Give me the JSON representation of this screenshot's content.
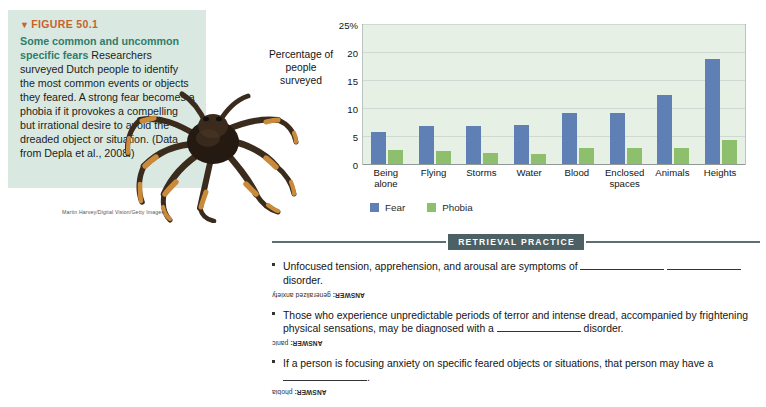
{
  "figure": {
    "number_label": "FIGURE 50.1",
    "triangle_glyph": "▼",
    "title": "Some common and uncommon specific fears",
    "body": " Researchers surveyed Dutch people to identify the most common events or objects they feared. A strong fear becomes a phobia if it provokes a compelling but irrational desire to avoid the dreaded object or situation. (Data from Depla et al., 2008.)",
    "photo_credit": "Martin Harvey/Digital Vision/Getty Images",
    "panel_color": "#d9e9e2",
    "number_color": "#c8622a",
    "title_color": "#2f7d6a"
  },
  "chart_data": {
    "type": "bar",
    "title": "",
    "xlabel": "",
    "ylabel": "Percentage of people surveyed",
    "ylim": [
      0,
      25
    ],
    "yticks": [
      0,
      5,
      10,
      15,
      20,
      25
    ],
    "ytick_labels": [
      "0",
      "5",
      "10",
      "15",
      "20",
      "25%"
    ],
    "grid": true,
    "legend_position": "bottom-left",
    "categories": [
      "Being alone",
      "Flying",
      "Storms",
      "Water",
      "Blood",
      "Enclosed spaces",
      "Animals",
      "Heights"
    ],
    "category_lines": [
      [
        "Being",
        "alone"
      ],
      [
        "Flying"
      ],
      [
        "Storms"
      ],
      [
        "Water"
      ],
      [
        "Blood"
      ],
      [
        "Enclosed",
        "spaces"
      ],
      [
        "Animals"
      ],
      [
        "Heights"
      ]
    ],
    "series": [
      {
        "name": "Fear",
        "color": "#5f80b4",
        "values": [
          5.9,
          7.0,
          7.0,
          7.1,
          9.3,
          9.3,
          12.5,
          19.0
        ]
      },
      {
        "name": "Phobia",
        "color": "#8dbf6d",
        "values": [
          2.7,
          2.5,
          2.1,
          1.9,
          3.1,
          3.1,
          3.0,
          4.5
        ]
      }
    ]
  },
  "retrieval_practice": {
    "heading": "RETRIEVAL PRACTICE",
    "questions": [
      {
        "text_before": "Unfocused tension, apprehension, and arousal are symptoms of ",
        "text_middle": " ",
        "text_after": " disorder.",
        "answer_prefix": "ANSWER:",
        "answer": " generalized anxiety"
      },
      {
        "text_before": "Those who experience unpredictable periods of terror and intense dread, accompanied by frightening physical sensations, may be diagnosed with a ",
        "text_middle": "",
        "text_after": " disorder.",
        "answer_prefix": "ANSWER:",
        "answer": " panic"
      },
      {
        "text_before": "If a person is focusing anxiety on specific feared objects or situations, that person may have a ",
        "text_middle": "",
        "text_after": ".",
        "answer_prefix": "ANSWER:",
        "answer": " phobia"
      }
    ]
  }
}
